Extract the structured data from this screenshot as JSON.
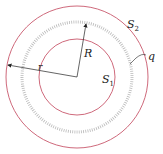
{
  "diagram": {
    "outer_surface_label": "S",
    "outer_surface_sub": "2",
    "inner_surface_label": "S",
    "inner_surface_sub": "1",
    "charge_label": "q",
    "radius_R_label": "R",
    "radius_r_label": "r",
    "colors": {
      "surface": "#c8586c",
      "charge_ring": "#b0b0b0",
      "arrow": "#222222"
    }
  }
}
